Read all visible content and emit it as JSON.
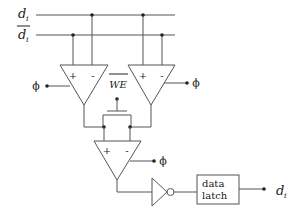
{
  "diagram": {
    "title": "",
    "signals": {
      "d_line": {
        "label": "d",
        "subscript": "i"
      },
      "d_bar_line": {
        "label": "d",
        "subscript": "i",
        "overbar": true
      },
      "output": {
        "label": "d",
        "subscript": "i"
      }
    },
    "sense_amps": [
      {
        "id": "amp-left",
        "plus": "+",
        "minus": "-",
        "clock": "ϕ"
      },
      {
        "id": "amp-right",
        "plus": "+",
        "minus": "-",
        "clock": "ϕ"
      },
      {
        "id": "amp-bottom",
        "plus": "+",
        "minus": "-",
        "clock": "ϕ"
      }
    ],
    "write_enable": {
      "label": "WE",
      "overbar": true
    },
    "data_latch": {
      "line1": "data",
      "line2": "latch"
    },
    "colors": {
      "line": "#555555",
      "text": "#222222",
      "background": "#ffffff"
    }
  }
}
